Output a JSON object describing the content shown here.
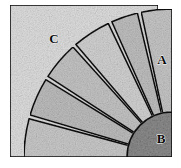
{
  "figure": {
    "background_color": "#ffffff",
    "outline_color": "#111111",
    "canvas": {
      "width": 181,
      "height": 168
    }
  },
  "pivot": {
    "x": 172,
    "y": 157
  },
  "square": {
    "name": "C",
    "label": "C",
    "label_x": 54,
    "label_y": 40,
    "x": 10,
    "y": 5,
    "width": 148,
    "height": 152,
    "fill": "#dedede",
    "texture": "stipple"
  },
  "fan": {
    "outer_radius": 148,
    "inner_radius": 45,
    "start_angle_deg": 180,
    "end_angle_deg": 270,
    "wedge_count": 6,
    "wedges": [
      {
        "name": "wedge-1",
        "a0": 180.0,
        "a1": 195.0,
        "fill": "#c9c9c9"
      },
      {
        "name": "wedge-2",
        "a0": 196.5,
        "a1": 211.5,
        "fill": "#bdbdbd"
      },
      {
        "name": "wedge-3",
        "a0": 213.0,
        "a1": 228.0,
        "fill": "#c4c4c4"
      },
      {
        "name": "wedge-4",
        "a0": 229.5,
        "a1": 244.5,
        "fill": "#d2d2d2"
      },
      {
        "name": "wedge-5",
        "a0": 246.0,
        "a1": 256.5,
        "fill": "#bfbfbf"
      },
      {
        "name": "wedge-6",
        "a0": 258.0,
        "a1": 270.0,
        "fill": "#c6c6c6"
      }
    ]
  },
  "wedge_a": {
    "name": "A",
    "label": "A",
    "label_x": 162,
    "label_y": 61,
    "fill": "#c6c6c6"
  },
  "sector_b": {
    "name": "B",
    "label": "B",
    "label_x": 161,
    "label_y": 140,
    "radius": 45,
    "fill": "#8e8e8e",
    "texture": "coarse-stipple"
  },
  "labels": [
    {
      "id": "label-a",
      "text": "A"
    },
    {
      "id": "label-b",
      "text": "B"
    },
    {
      "id": "label-c",
      "text": "C"
    }
  ]
}
